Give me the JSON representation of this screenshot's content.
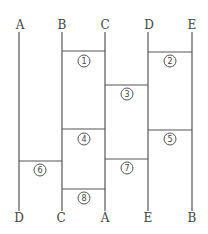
{
  "top_labels": [
    "A",
    "B",
    "C",
    "D",
    "E"
  ],
  "bottom_labels": [
    "D",
    "C",
    "A",
    "E",
    "B"
  ],
  "rungs": [
    {
      "num": "1",
      "label": "①",
      "from": 1,
      "to": 2,
      "y": 51
    },
    {
      "num": "2",
      "label": "②",
      "from": 3,
      "to": 4,
      "y": 52
    },
    {
      "num": "3",
      "label": "③",
      "from": 2,
      "to": 3,
      "y": 85
    },
    {
      "num": "4",
      "label": "④",
      "from": 1,
      "to": 2,
      "y": 129
    },
    {
      "num": "5",
      "label": "⑤",
      "from": 3,
      "to": 4,
      "y": 130
    },
    {
      "num": "6",
      "label": "⑥",
      "from": 0,
      "to": 1,
      "y": 161
    },
    {
      "num": "7",
      "label": "⑦",
      "from": 2,
      "to": 3,
      "y": 159
    },
    {
      "num": "8",
      "label": "⑧",
      "from": 1,
      "to": 2,
      "y": 189
    }
  ]
}
